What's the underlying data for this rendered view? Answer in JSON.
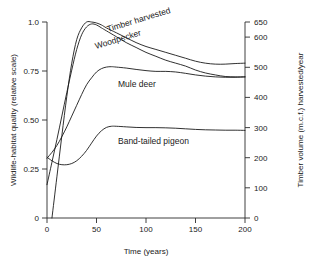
{
  "chart_data": {
    "type": "line",
    "title": "",
    "xlabel": "Time (years)",
    "ylabel": "Wildlife-habitat quality (relative scale)",
    "y2label": "Timber volume (m.c.f.) harvested/year",
    "xlim": [
      0,
      200
    ],
    "ylim": [
      0,
      1.0
    ],
    "y2lim": [
      0,
      650
    ],
    "grid": false,
    "legend_position": "inline-curve-labels",
    "xticks": [
      0,
      50,
      100,
      150,
      200
    ],
    "xtick_labels": [
      "0",
      "50",
      "100",
      "150",
      "200"
    ],
    "yticks": [
      0,
      0.25,
      0.5,
      0.75,
      1.0
    ],
    "ytick_labels": [
      "0",
      "0.25",
      "0.50",
      "0.75",
      "1.0"
    ],
    "y2ticks": [
      0,
      100,
      200,
      300,
      400,
      500,
      600,
      650
    ],
    "y2tick_labels": [
      "0",
      "100",
      "200",
      "300",
      "400",
      "500",
      "600",
      "650"
    ],
    "series": [
      {
        "name": "Timber harvested",
        "label": "Timber harvested",
        "label_rotation": -17,
        "label_x": 108,
        "label_y": 32,
        "x": [
          5,
          10,
          15,
          20,
          25,
          30,
          35,
          40,
          45,
          50,
          55,
          60,
          70,
          80,
          90,
          100,
          110,
          120,
          130,
          140,
          150,
          160,
          170,
          180,
          190,
          200
        ],
        "y": [
          0.0,
          0.21,
          0.42,
          0.62,
          0.79,
          0.91,
          0.97,
          1.0,
          1.0,
          0.995,
          0.985,
          0.97,
          0.945,
          0.92,
          0.895,
          0.875,
          0.86,
          0.845,
          0.83,
          0.815,
          0.8,
          0.79,
          0.785,
          0.785,
          0.788,
          0.79
        ]
      },
      {
        "name": "Woodpecker",
        "label": "Woodpecker",
        "label_rotation": -17,
        "label_x": 96,
        "label_y": 49,
        "x": [
          0,
          5,
          10,
          15,
          20,
          25,
          30,
          35,
          40,
          45,
          50,
          55,
          60,
          70,
          80,
          90,
          100,
          110,
          120,
          130,
          140,
          150,
          160,
          170,
          180,
          190,
          200
        ],
        "y": [
          0.17,
          0.285,
          0.4,
          0.52,
          0.64,
          0.755,
          0.86,
          0.935,
          0.975,
          0.99,
          0.985,
          0.97,
          0.955,
          0.925,
          0.895,
          0.87,
          0.845,
          0.825,
          0.805,
          0.79,
          0.775,
          0.755,
          0.74,
          0.73,
          0.722,
          0.72,
          0.72
        ]
      },
      {
        "name": "Mule deer",
        "label": "Mule deer",
        "label_rotation": 0,
        "label_x": 118,
        "label_y": 87,
        "x": [
          0,
          5,
          10,
          15,
          20,
          25,
          30,
          35,
          40,
          45,
          50,
          55,
          60,
          65,
          70,
          80,
          90,
          100,
          110,
          120,
          130,
          140,
          150,
          160,
          170,
          180,
          190,
          200
        ],
        "y": [
          0.305,
          0.335,
          0.37,
          0.415,
          0.465,
          0.52,
          0.575,
          0.63,
          0.68,
          0.715,
          0.745,
          0.762,
          0.77,
          0.772,
          0.77,
          0.765,
          0.758,
          0.752,
          0.748,
          0.748,
          0.745,
          0.738,
          0.73,
          0.724,
          0.72,
          0.718,
          0.718,
          0.72
        ]
      },
      {
        "name": "Band-tailed pigeon",
        "label": "Band-tailed pigeon",
        "label_rotation": 0,
        "label_x": 118,
        "label_y": 144,
        "x": [
          0,
          5,
          10,
          15,
          20,
          25,
          30,
          35,
          40,
          45,
          50,
          55,
          60,
          65,
          70,
          80,
          90,
          100,
          110,
          120,
          130,
          140,
          150,
          160,
          170,
          180,
          190,
          200
        ],
        "y": [
          0.31,
          0.292,
          0.278,
          0.272,
          0.272,
          0.278,
          0.292,
          0.315,
          0.345,
          0.382,
          0.418,
          0.445,
          0.462,
          0.468,
          0.468,
          0.465,
          0.462,
          0.461,
          0.461,
          0.46,
          0.458,
          0.455,
          0.452,
          0.45,
          0.449,
          0.448,
          0.448,
          0.447
        ]
      }
    ]
  },
  "axes": {
    "left": {
      "title": "Wildlife-habitat quality (relative scale)",
      "ticks": [
        "1.0",
        "0.75",
        "0.50",
        "0.25",
        "0"
      ]
    },
    "right": {
      "title": "Timber volume (m.c.f.) harvested/year",
      "ticks": [
        "650",
        "600",
        "500",
        "400",
        "300",
        "200",
        "100",
        "0"
      ]
    },
    "bottom": {
      "title": "Time (years)",
      "ticks": [
        "0",
        "50",
        "100",
        "150",
        "200"
      ]
    }
  },
  "colors": {
    "line": "#1a1a1a",
    "axis": "#2b2b2b",
    "text": "#1a1a1a",
    "background": "#ffffff"
  }
}
